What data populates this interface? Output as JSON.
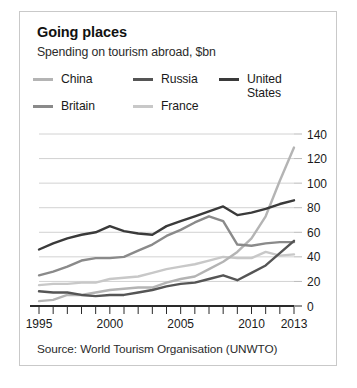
{
  "card": {
    "title": "Going places",
    "subtitle": "Spending on tourism abroad, $bn",
    "source": "Source: World Tourism Organisation (UNWTO)"
  },
  "legend": {
    "row1": [
      {
        "label": "China",
        "color": "#b4b4b4"
      },
      {
        "label": "Russia",
        "color": "#555555"
      },
      {
        "label": "United\nStates",
        "color": "#3a3a3a"
      }
    ],
    "row2": [
      {
        "label": "Britain",
        "color": "#8a8a8a"
      },
      {
        "label": "France",
        "color": "#c8c8c8"
      }
    ]
  },
  "chart_data": {
    "type": "line",
    "title": "Going places",
    "subtitle": "Spending on tourism abroad, $bn",
    "xlabel": "",
    "ylabel": "$bn",
    "xlim": [
      1995,
      2013
    ],
    "ylim": [
      0,
      140
    ],
    "ytick_step": 20,
    "yticks": [
      0,
      20,
      40,
      60,
      80,
      100,
      120,
      140
    ],
    "xticks": [
      1995,
      1996,
      1997,
      1998,
      1999,
      2000,
      2001,
      2002,
      2003,
      2004,
      2005,
      2006,
      2007,
      2008,
      2009,
      2010,
      2011,
      2012,
      2013
    ],
    "xtick_labels_shown": [
      1995,
      2000,
      2005,
      2010,
      2013
    ],
    "grid": "horizontal",
    "legend_position": "top",
    "x": [
      1995,
      1996,
      1997,
      1998,
      1999,
      2000,
      2001,
      2002,
      2003,
      2004,
      2005,
      2006,
      2007,
      2008,
      2009,
      2010,
      2011,
      2012,
      2013
    ],
    "series": [
      {
        "name": "United States",
        "color": "#3a3a3a",
        "values": [
          46,
          51,
          55,
          58,
          60,
          65,
          61,
          59,
          58,
          65,
          69,
          73,
          77,
          81,
          74,
          76,
          79,
          83,
          86
        ]
      },
      {
        "name": "Britain",
        "color": "#8a8a8a",
        "values": [
          25,
          28,
          32,
          37,
          39,
          39,
          40,
          45,
          50,
          57,
          62,
          68,
          73,
          69,
          50,
          49,
          51,
          52,
          52
        ]
      },
      {
        "name": "France",
        "color": "#c8c8c8",
        "values": [
          17,
          18,
          18,
          19,
          19,
          22,
          23,
          24,
          27,
          30,
          32,
          34,
          37,
          40,
          39,
          39,
          44,
          41,
          42
        ]
      },
      {
        "name": "Russia",
        "color": "#555555",
        "values": [
          12,
          11,
          11,
          9,
          8,
          9,
          9,
          11,
          13,
          16,
          18,
          19,
          22,
          25,
          21,
          27,
          33,
          43,
          53
        ]
      },
      {
        "name": "China",
        "color": "#b4b4b4",
        "values": [
          4,
          5,
          9,
          9,
          11,
          13,
          14,
          15,
          15,
          19,
          22,
          24,
          30,
          36,
          44,
          55,
          73,
          102,
          129
        ]
      }
    ]
  }
}
